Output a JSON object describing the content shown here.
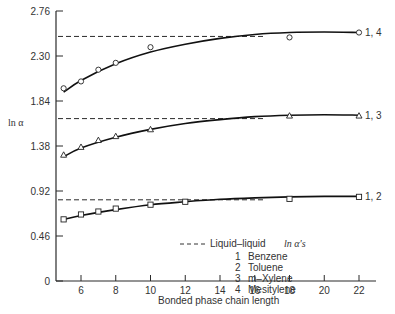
{
  "chart_data": {
    "type": "line",
    "title": "",
    "xlabel": "Bonded phase chain length",
    "ylabel": "ln α",
    "xlim": [
      4.4,
      23.2
    ],
    "ylim": [
      0,
      2.76
    ],
    "xticks": [
      6,
      8,
      10,
      12,
      14,
      16,
      18,
      20,
      22
    ],
    "xtick_labels": [
      "6",
      "8",
      "10",
      "12",
      "14",
      "16",
      "18",
      "20",
      "22"
    ],
    "yticks": [
      0,
      0.46,
      0.92,
      1.38,
      1.84,
      2.3,
      2.76
    ],
    "ytick_labels": [
      "0",
      "0.46",
      "0.92",
      "1.38",
      "1.84",
      "2.30",
      "2.76"
    ],
    "grid": false,
    "series": [
      {
        "name": "1, 4",
        "marker": "circle",
        "x": [
          5,
          6,
          7,
          8,
          10,
          18,
          22
        ],
        "values": [
          1.97,
          2.04,
          2.16,
          2.23,
          2.39,
          2.49,
          2.54
        ],
        "curve": [
          [
            5,
            1.93
          ],
          [
            6,
            2.05
          ],
          [
            8,
            2.22
          ],
          [
            10,
            2.34
          ],
          [
            12,
            2.42
          ],
          [
            14,
            2.48
          ],
          [
            16,
            2.52
          ],
          [
            18,
            2.54
          ],
          [
            20,
            2.545
          ],
          [
            22,
            2.54
          ]
        ],
        "liquid_liquid": 2.5
      },
      {
        "name": "1, 3",
        "marker": "triangle",
        "x": [
          5,
          6,
          7,
          8,
          10,
          18,
          22
        ],
        "values": [
          1.29,
          1.37,
          1.44,
          1.48,
          1.55,
          1.69,
          1.69
        ],
        "curve": [
          [
            5,
            1.27
          ],
          [
            6,
            1.36
          ],
          [
            8,
            1.47
          ],
          [
            10,
            1.55
          ],
          [
            12,
            1.61
          ],
          [
            14,
            1.65
          ],
          [
            16,
            1.68
          ],
          [
            18,
            1.695
          ],
          [
            20,
            1.7
          ],
          [
            22,
            1.695
          ]
        ],
        "liquid_liquid": 1.66
      },
      {
        "name": "1, 2",
        "marker": "square",
        "x": [
          5,
          6,
          7,
          8,
          10,
          12,
          18,
          22
        ],
        "values": [
          0.63,
          0.68,
          0.71,
          0.74,
          0.78,
          0.81,
          0.84,
          0.86
        ],
        "curve": [
          [
            5,
            0.63
          ],
          [
            6,
            0.67
          ],
          [
            8,
            0.73
          ],
          [
            10,
            0.78
          ],
          [
            12,
            0.81
          ],
          [
            14,
            0.835
          ],
          [
            16,
            0.85
          ],
          [
            18,
            0.86
          ],
          [
            20,
            0.865
          ],
          [
            22,
            0.865
          ]
        ],
        "liquid_liquid": 0.83
      }
    ],
    "legend": {
      "position": "lower-right",
      "dash_entry": "Liquid–liquid",
      "dash_entry_suffix": "ln α's",
      "items": [
        {
          "num": "1",
          "label": "Benzene"
        },
        {
          "num": "2",
          "label": "Toluene"
        },
        {
          "num": "3",
          "label": "m–Xylene"
        },
        {
          "num": "4",
          "label": "Mesitylene"
        }
      ]
    }
  }
}
